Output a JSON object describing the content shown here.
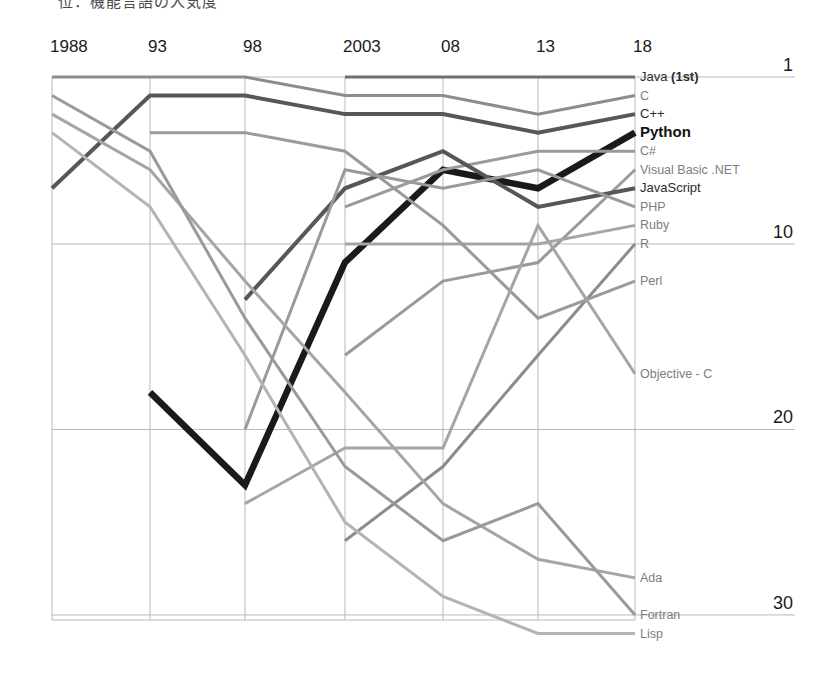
{
  "caption": {
    "text": "位：機能言語の人気度",
    "note": "partially-cropped-heading"
  },
  "axes": {
    "x_ticks": [
      "1988",
      "93",
      "98",
      "2003",
      "08",
      "13",
      "18"
    ],
    "y_ticks": [
      "1",
      "10",
      "20",
      "30"
    ],
    "x_label": "",
    "y_label": ""
  },
  "colors": {
    "python": "#1a1a1a",
    "dark_gray": "#575757",
    "mid_gray": "#8c8c8c",
    "light_gray": "#b4b4b4",
    "grid": "#b9b9b9",
    "text": "#1a1a1a"
  },
  "chart_data": {
    "type": "line",
    "title": "",
    "subtitle": "",
    "xlabel": "",
    "ylabel": "",
    "x": [
      1988,
      1993,
      1998,
      2003,
      2008,
      2013,
      2018
    ],
    "x_tick_labels": [
      "1988",
      "93",
      "98",
      "2003",
      "08",
      "13",
      "18"
    ],
    "ylim": [
      1,
      32
    ],
    "y_ticks": [
      1,
      10,
      20,
      30
    ],
    "y_inverted": true,
    "grid": true,
    "legend": "right-inline-labels",
    "note": "Ranking of programming language popularity; rank 1 is best (top). Nulls mean the language was not ranked that year.",
    "series": [
      {
        "name": "Java (1st)",
        "label": "Java (1st)",
        "emphasis": "normal",
        "color": "#6e6e6e",
        "values": [
          null,
          null,
          null,
          1,
          1,
          1,
          1
        ]
      },
      {
        "name": "C",
        "label": "C",
        "emphasis": "normal",
        "color": "#8c8c8c",
        "values": [
          1,
          1,
          1,
          2,
          2,
          3,
          2
        ]
      },
      {
        "name": "C++",
        "label": "C++",
        "emphasis": "normal",
        "color": "#575757",
        "values": [
          7,
          2,
          2,
          3,
          3,
          4,
          3
        ]
      },
      {
        "name": "Python",
        "label": "Python",
        "emphasis": "bold",
        "color": "#1a1a1a",
        "values": [
          null,
          18,
          23,
          11,
          6,
          7,
          4
        ]
      },
      {
        "name": "C#",
        "label": "C#",
        "emphasis": "normal",
        "color": "#9a9a9a",
        "values": [
          null,
          null,
          null,
          8,
          6,
          5,
          5
        ]
      },
      {
        "name": "Visual Basic .NET",
        "label": "Visual Basic .NET",
        "emphasis": "normal",
        "color": "#9a9a9a",
        "values": [
          null,
          null,
          null,
          16,
          12,
          11,
          6
        ]
      },
      {
        "name": "JavaScript",
        "label": "JavaScript",
        "emphasis": "normal",
        "color": "#575757",
        "values": [
          null,
          null,
          13,
          7,
          5,
          8,
          7
        ]
      },
      {
        "name": "PHP",
        "label": "PHP",
        "emphasis": "normal",
        "color": "#9a9a9a",
        "values": [
          null,
          null,
          20,
          6,
          7,
          6,
          8
        ]
      },
      {
        "name": "Ruby",
        "label": "Ruby",
        "emphasis": "normal",
        "color": "#a5a5a5",
        "values": [
          null,
          null,
          null,
          10,
          10,
          10,
          9
        ]
      },
      {
        "name": "R",
        "label": "R",
        "emphasis": "normal",
        "color": "#8c8c8c",
        "values": [
          null,
          null,
          null,
          26,
          22,
          16,
          10
        ]
      },
      {
        "name": "Perl",
        "label": "Perl",
        "emphasis": "normal",
        "color": "#9a9a9a",
        "values": [
          null,
          4,
          4,
          5,
          9,
          14,
          12
        ]
      },
      {
        "name": "Objective - C",
        "label": "Objective - C",
        "emphasis": "normal",
        "color": "#a5a5a5",
        "values": [
          null,
          null,
          24,
          21,
          21,
          9,
          17
        ]
      },
      {
        "name": "Ada",
        "label": "Ada",
        "emphasis": "normal",
        "color": "#a5a5a5",
        "values": [
          3,
          6,
          12,
          18,
          24,
          27,
          28
        ]
      },
      {
        "name": "Fortran",
        "label": "Fortran",
        "emphasis": "normal",
        "color": "#9a9a9a",
        "values": [
          2,
          5,
          14,
          22,
          26,
          24,
          30
        ]
      },
      {
        "name": "Lisp",
        "label": "Lisp",
        "emphasis": "normal",
        "color": "#b4b4b4",
        "values": [
          4,
          8,
          16,
          25,
          29,
          31,
          31
        ]
      }
    ],
    "right_labels": [
      {
        "text": "Java (1st)",
        "rank": 1,
        "style": "dark-bold-mixed"
      },
      {
        "text": "C",
        "rank": 2,
        "style": "mid"
      },
      {
        "text": "C++",
        "rank": 3,
        "style": "dark"
      },
      {
        "text": "Python",
        "rank": 4,
        "style": "bold"
      },
      {
        "text": "C#",
        "rank": 5,
        "style": "mid"
      },
      {
        "text": "Visual Basic .NET",
        "rank": 6,
        "style": "mid"
      },
      {
        "text": "JavaScript",
        "rank": 7,
        "style": "dark"
      },
      {
        "text": "PHP",
        "rank": 8,
        "style": "mid"
      },
      {
        "text": "Ruby",
        "rank": 9,
        "style": "mid"
      },
      {
        "text": "R",
        "rank": 10,
        "style": "mid"
      },
      {
        "text": "Perl",
        "rank": 12,
        "style": "mid"
      },
      {
        "text": "Objective - C",
        "rank": 17,
        "style": "mid"
      },
      {
        "text": "Ada",
        "rank": 28,
        "style": "mid"
      },
      {
        "text": "Fortran",
        "rank": 30,
        "style": "mid"
      },
      {
        "text": "Lisp",
        "rank": 31,
        "style": "mid"
      }
    ]
  }
}
